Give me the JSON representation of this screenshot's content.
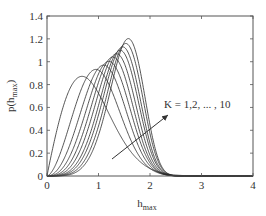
{
  "chart_data": {
    "type": "line",
    "title": "",
    "xlabel": "h_max",
    "ylabel": "p(h_max)",
    "xlim": [
      0,
      4
    ],
    "ylim": [
      0,
      1.4
    ],
    "grid": false,
    "x_ticks": [
      "0",
      "1",
      "2",
      "3",
      "4"
    ],
    "y_ticks": [
      "0",
      "0.2",
      "0.4",
      "0.6",
      "0.8",
      "1",
      "1.2",
      "1.4"
    ],
    "annotation": {
      "text": "K = 1,2, ... , 10",
      "arrow_from": [
        1.27,
        0.15
      ],
      "arrow_to": [
        2.35,
        0.54
      ]
    },
    "series_model": "Weibull pdf p(h) = (k/l)(h/l)^(k-1) exp(-(h/l)^k)",
    "series": [
      {
        "name": "K=1",
        "shape": 1.97,
        "scale": 0.974,
        "mode": 0.68,
        "peak": 0.86
      },
      {
        "name": "K=2",
        "shape": 2.65,
        "scale": 1.135,
        "mode": 0.95,
        "peak": 0.93
      },
      {
        "name": "K=3",
        "shape": 3.1,
        "scale": 1.247,
        "mode": 1.1,
        "peak": 0.97
      },
      {
        "name": "K=4",
        "shape": 3.45,
        "scale": 1.326,
        "mode": 1.2,
        "peak": 1.0
      },
      {
        "name": "K=5",
        "shape": 3.78,
        "scale": 1.388,
        "mode": 1.28,
        "peak": 1.04
      },
      {
        "name": "K=6",
        "shape": 4.07,
        "scale": 1.447,
        "mode": 1.35,
        "peak": 1.07
      },
      {
        "name": "K=7",
        "shape": 4.38,
        "scale": 1.506,
        "mode": 1.42,
        "peak": 1.1
      },
      {
        "name": "K=8",
        "shape": 4.64,
        "scale": 1.549,
        "mode": 1.47,
        "peak": 1.13
      },
      {
        "name": "K=9",
        "shape": 4.94,
        "scale": 1.602,
        "mode": 1.53,
        "peak": 1.16
      },
      {
        "name": "K=10",
        "shape": 5.27,
        "scale": 1.644,
        "mode": 1.58,
        "peak": 1.2
      }
    ]
  },
  "labels": {
    "xlabel_main": "h",
    "xlabel_sub": "max",
    "ylabel_main": "p(h",
    "ylabel_sub": "max",
    "ylabel_close": ")",
    "annotation": "K = 1,2, ... , 10"
  },
  "style": {
    "line_color": "#2a2a2a",
    "axis_color": "#555555"
  }
}
